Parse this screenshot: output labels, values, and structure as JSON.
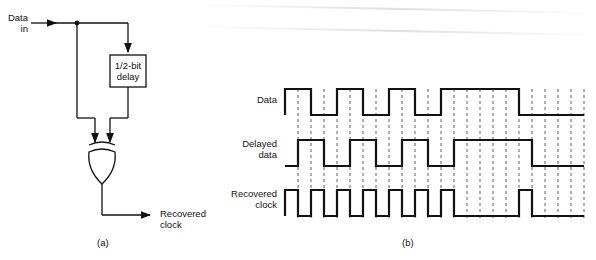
{
  "circuit": {
    "input_label_line1": "Data",
    "input_label_line2": "in",
    "delay_label_line1": "1/2-bit",
    "delay_label_line2": "delay",
    "gate": "XOR",
    "output_label_line1": "Recovered",
    "output_label_line2": "clock",
    "caption": "(a)"
  },
  "timing": {
    "caption": "(b)",
    "signals": [
      {
        "label_line1": "Data",
        "label_line2": "",
        "levels": [
          1,
          1,
          0,
          0,
          1,
          1,
          0,
          0,
          1,
          1,
          0,
          0,
          1,
          1,
          1,
          1,
          1,
          1,
          0,
          0,
          0,
          0,
          0
        ]
      },
      {
        "label_line1": "Delayed",
        "label_line2": "data",
        "levels": [
          0,
          1,
          1,
          0,
          0,
          1,
          1,
          0,
          0,
          1,
          1,
          0,
          0,
          1,
          1,
          1,
          1,
          1,
          1,
          0,
          0,
          0,
          0
        ]
      },
      {
        "label_line1": "Recovered",
        "label_line2": "clock",
        "levels": [
          1,
          0,
          1,
          0,
          1,
          0,
          1,
          0,
          1,
          0,
          1,
          0,
          1,
          0,
          0,
          0,
          0,
          0,
          1,
          0,
          0,
          0,
          0
        ]
      }
    ],
    "half_bit_count": 23
  }
}
